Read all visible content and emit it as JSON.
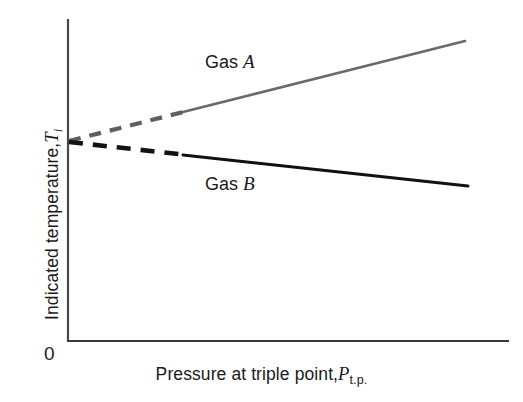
{
  "chart_data": {
    "type": "line",
    "title": "",
    "xlabel_text": "Pressure at triple point,",
    "xlabel_symbol": "P",
    "xlabel_subscript": "t.p.",
    "ylabel_text": "Indicated temperature,",
    "ylabel_symbol": "T",
    "ylabel_subscript": "i",
    "origin_tick_label": "0",
    "xlim": [
      0,
      100
    ],
    "ylim": [
      0,
      100
    ],
    "grid": false,
    "legend_position": "inline-annotation",
    "axis_ticks": "none",
    "common_intercept_note": "Both gas curves extrapolate to the same indicated temperature at zero triple-point pressure",
    "series": [
      {
        "name": "Gas A",
        "label": "Gas A",
        "color": "#6a6a6a",
        "line_width_px": 2.6,
        "label_x": 205,
        "label_y": 63,
        "solid_segment": {
          "x1": 68,
          "y1": 141,
          "x2": 465,
          "y2": 41
        },
        "dashed_segment": {
          "x1": 68,
          "y1": 141,
          "x2": 185,
          "y2": 111
        },
        "dash_pattern": "12 9",
        "extrapolated": true,
        "trend": "increasing",
        "points": [
          {
            "x": 0,
            "y": 50.0
          },
          {
            "x": 26.5,
            "y": 57.0
          },
          {
            "x": 50.0,
            "y": 63.5
          },
          {
            "x": 75.0,
            "y": 70.0
          },
          {
            "x": 100.0,
            "y": 76.5
          }
        ]
      },
      {
        "name": "Gas B",
        "label": "Gas B",
        "color": "#111111",
        "line_width_px": 3.0,
        "label_x": 205,
        "label_y": 185,
        "solid_segment": {
          "x1": 68,
          "y1": 141,
          "x2": 468,
          "y2": 186
        },
        "dashed_segment": {
          "x1": 68,
          "y1": 141,
          "x2": 185,
          "y2": 154
        },
        "dash_pattern": "14 10",
        "extrapolated": true,
        "trend": "decreasing",
        "points": [
          {
            "x": 0,
            "y": 50.0
          },
          {
            "x": 26.5,
            "y": 46.8
          },
          {
            "x": 50.0,
            "y": 43.8
          },
          {
            "x": 75.0,
            "y": 40.8
          },
          {
            "x": 100.0,
            "y": 37.8
          }
        ]
      }
    ],
    "axes": {
      "y_axis": {
        "x": 68,
        "y_top": 20,
        "y_bottom": 341,
        "color": "#444444",
        "width_px": 2
      },
      "x_axis": {
        "y": 341,
        "x_left": 68,
        "x_right": 508,
        "color": "#333333",
        "width_px": 2
      }
    }
  }
}
